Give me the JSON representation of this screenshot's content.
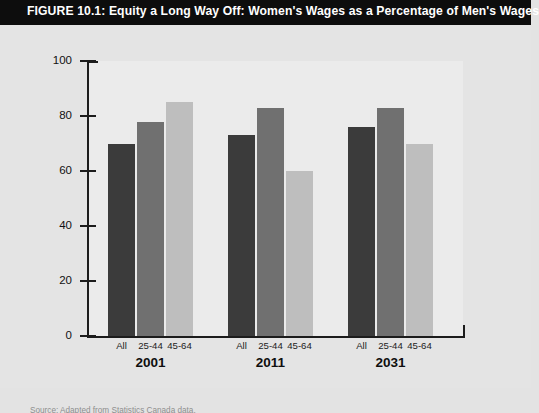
{
  "figure": {
    "title": "FIGURE 10.1: Equity a Long Way Off: Women's Wages as a Percentage of Men's Wages",
    "source_note": "Source: Adapted from Statistics Canada data."
  },
  "chart_data": {
    "type": "bar",
    "title": "FIGURE 10.1: Equity a Long Way Off: Women's Wages as a Percentage of Men's Wages",
    "xlabel": "",
    "ylabel": "",
    "ylim": [
      0,
      100
    ],
    "yticks": [
      0,
      20,
      40,
      60,
      80,
      100
    ],
    "grid": false,
    "legend": "none",
    "categories": [
      "2001",
      "2011",
      "2031"
    ],
    "subcategories": [
      "All",
      "25-44",
      "45-64"
    ],
    "series": [
      {
        "name": "All",
        "color": "#3b3b3b",
        "values": [
          70,
          73,
          76
        ]
      },
      {
        "name": "25-44",
        "color": "#707070",
        "values": [
          78,
          83,
          83
        ]
      },
      {
        "name": "45-64",
        "color": "#bebebe",
        "values": [
          85,
          60,
          70
        ]
      }
    ],
    "groups": [
      {
        "year": "2001",
        "bars": [
          {
            "label": "All",
            "value": 70,
            "color": "#3b3b3b"
          },
          {
            "label": "25-44",
            "value": 78,
            "color": "#707070"
          },
          {
            "label": "45-64",
            "value": 85,
            "color": "#bebebe"
          }
        ]
      },
      {
        "year": "2011",
        "bars": [
          {
            "label": "All",
            "value": 73,
            "color": "#3b3b3b"
          },
          {
            "label": "25-44",
            "value": 83,
            "color": "#707070"
          },
          {
            "label": "45-64",
            "value": 60,
            "color": "#bebebe"
          }
        ]
      },
      {
        "year": "2031",
        "bars": [
          {
            "label": "All",
            "value": 76,
            "color": "#3b3b3b"
          },
          {
            "label": "25-44",
            "value": 83,
            "color": "#707070"
          },
          {
            "label": "45-64",
            "value": 70,
            "color": "#bebebe"
          }
        ]
      }
    ]
  },
  "axis": {
    "y_tick_labels": [
      "100",
      "80",
      "60",
      "40",
      "20",
      "0"
    ]
  },
  "colors": {
    "title_bar": "#0d0d0d",
    "title_text": "#ffffff",
    "page_background": "#e4e4e4",
    "plot_background": "#ebebeb",
    "axis": "#1c1c1c",
    "bar_dark": "#3b3b3b",
    "bar_medium": "#707070",
    "bar_light": "#bebebe"
  }
}
